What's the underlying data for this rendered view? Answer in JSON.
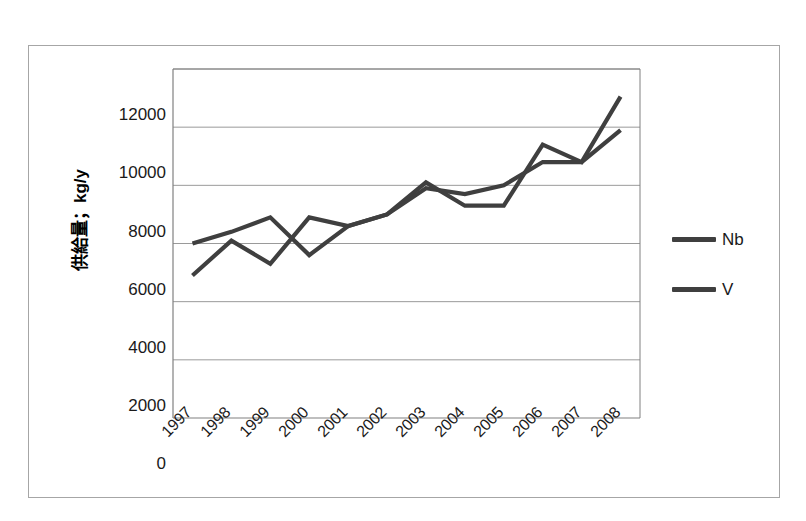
{
  "chart_data": {
    "type": "line",
    "title": "",
    "xlabel": "",
    "ylabel": "供給量；kg/y",
    "categories": [
      "1997",
      "1998",
      "1999",
      "2000",
      "2001",
      "2002",
      "2003",
      "2004",
      "2005",
      "2006",
      "2007",
      "2008"
    ],
    "series": [
      {
        "name": "Nb",
        "color": "#3f3f3f",
        "values": [
          6000,
          6400,
          6900,
          5600,
          6600,
          7000,
          8100,
          7300,
          7300,
          9400,
          8800,
          11050
        ]
      },
      {
        "name": "V",
        "color": "#3f3f3f",
        "values": [
          4900,
          6100,
          5300,
          6900,
          6600,
          7000,
          7900,
          7700,
          8000,
          8800,
          8800,
          9900
        ]
      }
    ],
    "ylim": [
      0,
      12000
    ],
    "y_ticks": [
      "0",
      "2000",
      "4000",
      "6000",
      "8000",
      "10000",
      "12000"
    ],
    "y_tick_values": [
      0,
      2000,
      4000,
      6000,
      8000,
      10000,
      12000
    ],
    "grid": "horizontal",
    "legend_position": "right",
    "legend_entries": [
      "Nb",
      "V"
    ],
    "axis_color": "#808080",
    "grid_color": "#9a9a9a",
    "frame_color": "#a6a6a6"
  }
}
